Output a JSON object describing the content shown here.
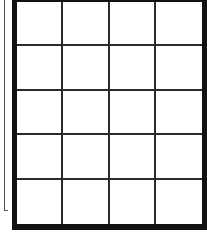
{
  "grid": {
    "rows": 5,
    "columns": 4,
    "cells": [
      [
        "",
        "",
        "",
        ""
      ],
      [
        "",
        "",
        "",
        ""
      ],
      [
        "",
        "",
        "",
        ""
      ],
      [
        "",
        "",
        "",
        ""
      ],
      [
        "",
        "",
        "",
        ""
      ]
    ],
    "border_color": "#111111",
    "line_color": "#2a2a2a",
    "fill_color": "#ffffff"
  },
  "side_rule": {
    "color": "#555555"
  }
}
